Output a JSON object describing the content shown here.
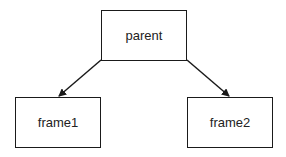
{
  "diagram": {
    "nodes": [
      {
        "id": "parent",
        "label": "parent"
      },
      {
        "id": "frame1",
        "label": "frame1"
      },
      {
        "id": "frame2",
        "label": "frame2"
      }
    ],
    "edges": [
      {
        "from": "parent",
        "to": "frame1"
      },
      {
        "from": "parent",
        "to": "frame2"
      }
    ]
  }
}
